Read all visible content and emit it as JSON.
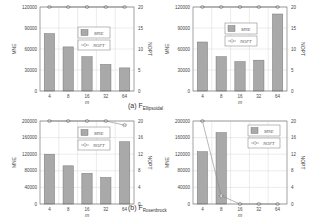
{
  "captions": [
    {
      "prefix": "(a) F",
      "sub": "Ellipsoidal"
    },
    {
      "prefix": "(b) F",
      "sub": "Rosenbrock"
    }
  ],
  "chart_data": [
    {
      "type": "bar",
      "panel": "top-left",
      "categories": [
        "4",
        "8",
        "16",
        "32",
        "64"
      ],
      "xlabel": "m",
      "ylabel": "MNE",
      "y2label": "NOPT",
      "ylim": [
        0,
        120000
      ],
      "yticks": [
        "0",
        "30000",
        "60000",
        "90000",
        "120000"
      ],
      "y2lim": [
        0,
        20
      ],
      "y2ticks": [
        "0",
        "5",
        "10",
        "15",
        "20"
      ],
      "series": [
        {
          "name": "MNE",
          "kind": "bar",
          "axis": "left",
          "values": [
            82000,
            63000,
            49000,
            38000,
            33000
          ]
        },
        {
          "name": "NOPT",
          "kind": "line",
          "axis": "right",
          "values": [
            20,
            20,
            20,
            20,
            20
          ]
        }
      ],
      "legend": "top-center",
      "grid": true
    },
    {
      "type": "bar",
      "panel": "top-right",
      "categories": [
        "4",
        "8",
        "16",
        "32",
        "64"
      ],
      "xlabel": "m",
      "ylabel": "MNE",
      "y2label": "NOPT",
      "ylim": [
        0,
        120000
      ],
      "yticks": [
        "0",
        "30000",
        "60000",
        "90000",
        "120000"
      ],
      "y2lim": [
        0,
        20
      ],
      "y2ticks": [
        "0",
        "5",
        "10",
        "15",
        "20"
      ],
      "series": [
        {
          "name": "MNE",
          "kind": "bar",
          "axis": "left",
          "values": [
            70000,
            49000,
            42000,
            44000,
            110000
          ]
        },
        {
          "name": "NOPT",
          "kind": "line",
          "axis": "right",
          "values": [
            20,
            20,
            20,
            20,
            20
          ]
        }
      ],
      "legend": "top-center",
      "grid": true
    },
    {
      "type": "bar",
      "panel": "bottom-left",
      "categories": [
        "4",
        "8",
        "16",
        "32",
        "64"
      ],
      "xlabel": "m",
      "ylabel": "MNE",
      "y2label": "NOPT",
      "ylim": [
        0,
        200000
      ],
      "yticks": [
        "0",
        "40000",
        "80000",
        "120000",
        "160000",
        "200000"
      ],
      "y2lim": [
        0,
        20
      ],
      "y2ticks": [
        "0",
        "4",
        "8",
        "12",
        "16",
        "20"
      ],
      "series": [
        {
          "name": "MNE",
          "kind": "bar",
          "axis": "left",
          "values": [
            120000,
            92000,
            74000,
            64000,
            150000
          ]
        },
        {
          "name": "NOPT",
          "kind": "line",
          "axis": "right",
          "values": [
            20,
            20,
            20,
            20,
            19
          ]
        }
      ],
      "legend": "top-center",
      "grid": true
    },
    {
      "type": "bar",
      "panel": "bottom-right",
      "categories": [
        "4",
        "8",
        "16",
        "32",
        "64"
      ],
      "xlabel": "m",
      "ylabel": "MNE",
      "y2label": "NOPT",
      "ylim": [
        0,
        200000
      ],
      "yticks": [
        "0",
        "40000",
        "80000",
        "120000",
        "160000",
        "200000"
      ],
      "y2lim": [
        0,
        20
      ],
      "y2ticks": [
        "0",
        "4",
        "8",
        "12",
        "16",
        "20"
      ],
      "series": [
        {
          "name": "MNE",
          "kind": "bar",
          "axis": "left",
          "values": [
            126000,
            172000,
            0,
            0,
            0
          ]
        },
        {
          "name": "NOPT",
          "kind": "line",
          "axis": "right",
          "values": [
            20,
            2,
            0,
            0,
            0
          ]
        }
      ],
      "legend": "top-right",
      "grid": true
    }
  ]
}
